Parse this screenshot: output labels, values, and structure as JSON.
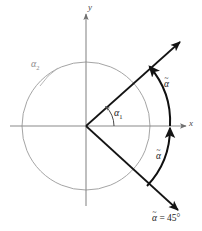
{
  "figure": {
    "background_color": "#ffffff"
  },
  "axes": {
    "x_label": "x",
    "y_label": "y",
    "axis_color": "#8a8a8a",
    "origin": {
      "x": 86,
      "y": 126
    }
  },
  "circle": {
    "center": {
      "x": 86,
      "y": 126
    },
    "radius": 64,
    "stroke_color": "#9a9a9a"
  },
  "rays": [
    {
      "name": "upper-ray",
      "angle_degrees": 45,
      "from": {
        "x": 86,
        "y": 126
      },
      "to": {
        "x": 182,
        "y": 40
      },
      "has_arrowhead": true,
      "color": "#141414"
    },
    {
      "name": "lower-ray",
      "angle_degrees": -45,
      "from": {
        "x": 86,
        "y": 126
      },
      "to": {
        "x": 180,
        "y": 212
      },
      "has_arrowhead": true,
      "color": "#141414"
    }
  ],
  "angle_arcs": [
    {
      "name": "alpha-1-arc",
      "label": "α",
      "subscript": "1",
      "radius": 28,
      "from_degrees": 0,
      "to_degrees": 45,
      "color": "#333333"
    },
    {
      "name": "alpha-2-arc",
      "label": "α",
      "subscript": "2",
      "radius": 64,
      "color": "#8c8c8c"
    }
  ],
  "reference_arcs": [
    {
      "name": "alpha-tilde-upper-arc",
      "label": "α̃",
      "from_degrees": 0,
      "to_degrees": 45,
      "radius": 84,
      "color": "#101010",
      "arrow_at": "upper-ray"
    },
    {
      "name": "alpha-tilde-lower-arc",
      "label": "α̃",
      "from_degrees": -45,
      "to_degrees": 0,
      "radius": 84,
      "color": "#101010",
      "arrow_at": "x-axis"
    }
  ],
  "labels": {
    "alpha_1": "α",
    "alpha_1_sub": "1",
    "alpha_2": "α",
    "alpha_2_sub": "2",
    "alpha_tilde_upper": "α",
    "alpha_tilde_lower": "α",
    "tilde_glyph": "~",
    "equation_alpha": "α",
    "equation_rest": " = 45°",
    "x_axis": "x",
    "y_axis": "y"
  }
}
